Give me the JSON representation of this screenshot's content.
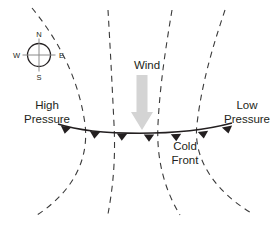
{
  "diagram": {
    "background_color": "#ffffff",
    "width": 279,
    "height": 227,
    "labels": {
      "high_pressure_line1": "High",
      "high_pressure_line2": "Pressure",
      "low_pressure_line1": "Low",
      "low_pressure_line2": "Pressure",
      "wind": "Wind",
      "cold_front_line1": "Cold",
      "cold_front_line2": "Front"
    },
    "compass": {
      "north": "N",
      "south": "S",
      "east": "E",
      "west": "W"
    },
    "colors": {
      "text": "#231f20",
      "isobar": "#3a3a3a",
      "front": "#231f20",
      "wind_arrow": "#d4d4d4",
      "compass_outline": "#231f20",
      "compass_cross": "#8a8a8a"
    },
    "geometry": {
      "isobars": [
        "M 32 8 C 55 36, 78 74, 85 124 C 90 166, 66 196, 37 215",
        "M 108 10 C 110 44, 112 82, 114 124 C 116 164, 112 192, 108 214",
        "M 172 10 C 166 46, 160 84, 158 124 C 156 162, 166 192, 180 215",
        "M 225 10 C 215 40, 202 80, 197 124 C 192 164, 222 196, 253 214"
      ],
      "front_line": "M 58 124 C 95 136, 180 137, 232 123",
      "front_barbs": [
        {
          "x": 66,
          "y": 126.6,
          "angle": 10
        },
        {
          "x": 95,
          "y": 131.5,
          "angle": 5
        },
        {
          "x": 122,
          "y": 133.6,
          "angle": 2
        },
        {
          "x": 149,
          "y": 134.5,
          "angle": 0
        },
        {
          "x": 176,
          "y": 134.0,
          "angle": -2
        },
        {
          "x": 203,
          "y": 131.4,
          "angle": -6
        },
        {
          "x": 227,
          "y": 126.5,
          "angle": -12
        }
      ],
      "wind_arrow": {
        "shaft_x": 142,
        "shaft_top": 75,
        "shaft_width": 11,
        "head_top": 112,
        "head_half_width": 11,
        "tip_y": 130
      },
      "compass": {
        "cx": 39,
        "cy": 55,
        "r": 11.5
      }
    }
  }
}
